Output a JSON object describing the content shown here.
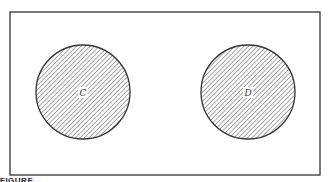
{
  "diagram": {
    "type": "venn",
    "universe": {
      "x": 10,
      "y": 12,
      "width": 310,
      "height": 163,
      "stroke": "#333333"
    },
    "sets": [
      {
        "label": "C",
        "cx": 83,
        "cy": 92,
        "r": 47,
        "fill": "hatched"
      },
      {
        "label": "D",
        "cx": 248,
        "cy": 92,
        "r": 47,
        "fill": "hatched"
      }
    ],
    "hatch_color": "#555555",
    "caption": "FIGURE"
  }
}
